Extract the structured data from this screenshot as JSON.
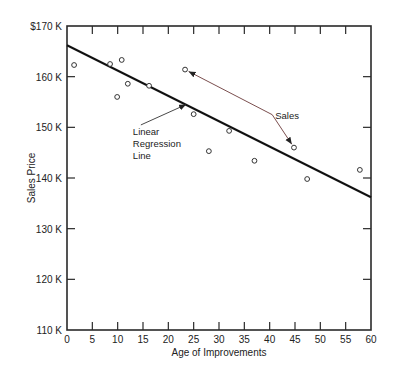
{
  "chart_data": {
    "type": "scatter",
    "title": "",
    "xlabel": "Age of Improvements",
    "ylabel": "Sales Price",
    "xlim": [
      0,
      60
    ],
    "ylim": [
      110,
      170
    ],
    "x_ticks": [
      0,
      5,
      10,
      15,
      20,
      25,
      30,
      35,
      40,
      45,
      50,
      55,
      60
    ],
    "x_tick_labels": [
      "0",
      "5",
      "10",
      "15",
      "20",
      "25",
      "30",
      "35",
      "40",
      "45",
      "50",
      "55",
      "60"
    ],
    "y_ticks": [
      110,
      120,
      130,
      140,
      150,
      160,
      170
    ],
    "y_tick_labels": [
      "110 K",
      "120 K",
      "130 K",
      "140 K",
      "150 K",
      "160 K",
      "$170 K"
    ],
    "grid": false,
    "legend": null,
    "series": [
      {
        "name": "Sales",
        "marker": "open-circle",
        "points": [
          {
            "x": 1.4,
            "y": 162.3
          },
          {
            "x": 8.5,
            "y": 162.5
          },
          {
            "x": 9.9,
            "y": 156.0
          },
          {
            "x": 10.8,
            "y": 163.3
          },
          {
            "x": 12.0,
            "y": 158.6
          },
          {
            "x": 16.2,
            "y": 158.2
          },
          {
            "x": 23.3,
            "y": 161.4
          },
          {
            "x": 25.0,
            "y": 152.6
          },
          {
            "x": 28.0,
            "y": 145.3
          },
          {
            "x": 32.0,
            "y": 149.3
          },
          {
            "x": 37.0,
            "y": 143.4
          },
          {
            "x": 44.8,
            "y": 146.0
          },
          {
            "x": 47.4,
            "y": 139.8
          },
          {
            "x": 57.8,
            "y": 141.6
          }
        ]
      },
      {
        "name": "Linear Regression Line",
        "type": "line",
        "points": [
          {
            "x": 0,
            "y": 166.2
          },
          {
            "x": 60,
            "y": 136.2
          }
        ]
      }
    ],
    "annotations": [
      {
        "text": "Sales",
        "x": 40.5,
        "y": 152.5,
        "arrows_to": [
          {
            "x": 23.3,
            "y": 161.4
          },
          {
            "x": 44.8,
            "y": 146.0
          }
        ]
      },
      {
        "text_lines": [
          "Linear",
          "Regression",
          "Line"
        ],
        "x": 13,
        "y": 148.5,
        "arrow_to": {
          "x": 23.5,
          "y": 154.5
        }
      }
    ]
  },
  "colors": {
    "axis": "#2a2a2a",
    "regression_line": "#111111",
    "marker": "#333333",
    "ylabel": "#3d6b3a",
    "sales_arrow": "#6b3a3a"
  }
}
